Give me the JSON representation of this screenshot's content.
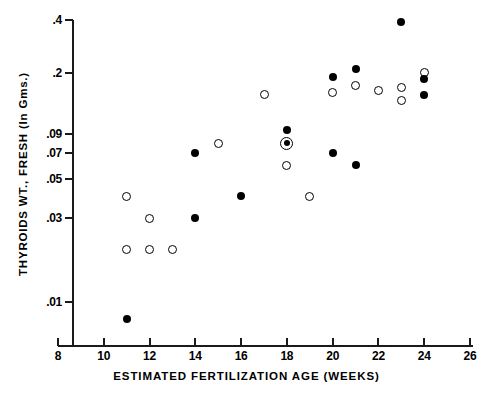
{
  "chart_data": {
    "type": "scatter",
    "title": "",
    "xlabel": "ESTIMATED FERTILIZATION AGE (WEEKS)",
    "ylabel": "THYROIDS WT., FRESH (In Gms.)",
    "xlim": [
      8,
      26
    ],
    "ylim": [
      0.008,
      0.4
    ],
    "yscale": "log",
    "xscale": "linear",
    "grid": false,
    "legend": "none",
    "xticks": [
      8,
      10,
      12,
      14,
      16,
      18,
      20,
      22,
      24,
      26
    ],
    "xticklabels": [
      "8",
      "10",
      "12",
      "14",
      "16",
      "18",
      "20",
      "22",
      "24",
      "26"
    ],
    "yticks": [
      0.4,
      0.2,
      0.09,
      0.07,
      0.05,
      0.03,
      0.01
    ],
    "yticklabels": [
      ".4",
      ".2",
      ".09",
      ".07",
      ".05",
      ".03",
      ".01"
    ],
    "series": [
      {
        "name": "open-circle",
        "marker": "open",
        "points": [
          {
            "x": 11,
            "y": 0.04
          },
          {
            "x": 11,
            "y": 0.02
          },
          {
            "x": 12,
            "y": 0.03
          },
          {
            "x": 12,
            "y": 0.02
          },
          {
            "x": 13,
            "y": 0.02
          },
          {
            "x": 15,
            "y": 0.08
          },
          {
            "x": 17,
            "y": 0.15
          },
          {
            "x": 18,
            "y": 0.06
          },
          {
            "x": 19,
            "y": 0.04
          },
          {
            "x": 20,
            "y": 0.155
          },
          {
            "x": 21,
            "y": 0.17
          },
          {
            "x": 22,
            "y": 0.16
          },
          {
            "x": 23,
            "y": 0.165
          },
          {
            "x": 23,
            "y": 0.14
          },
          {
            "x": 24,
            "y": 0.2
          }
        ]
      },
      {
        "name": "closed-circle",
        "marker": "closed",
        "points": [
          {
            "x": 11,
            "y": 0.008
          },
          {
            "x": 14,
            "y": 0.03
          },
          {
            "x": 14,
            "y": 0.07
          },
          {
            "x": 16,
            "y": 0.04
          },
          {
            "x": 18,
            "y": 0.095
          },
          {
            "x": 20,
            "y": 0.07
          },
          {
            "x": 20,
            "y": 0.19
          },
          {
            "x": 21,
            "y": 0.06
          },
          {
            "x": 21,
            "y": 0.21
          },
          {
            "x": 23,
            "y": 0.39
          },
          {
            "x": 24,
            "y": 0.185
          },
          {
            "x": 24,
            "y": 0.15
          }
        ]
      },
      {
        "name": "ringed-circle-coincident",
        "marker": "ringed",
        "points": [
          {
            "x": 18,
            "y": 0.08
          }
        ]
      }
    ]
  }
}
